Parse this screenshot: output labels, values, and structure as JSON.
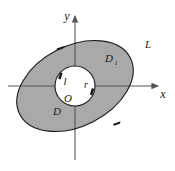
{
  "figure": {
    "background_color": "#ffffff",
    "shaded_fill_color": "#a9a9a9",
    "stroke_color": "#1a1a1a",
    "axis_color": "#555555",
    "inner_fill_color": "#ffffff",
    "axes": {
      "x_label": "x",
      "y_label": "y",
      "origin_label": "O"
    },
    "labels": {
      "outer_curve": "L",
      "inner_curve": "l",
      "inner_radius": "r",
      "outer_region": "D",
      "inner_region_main": "D",
      "inner_region_sub": "1"
    },
    "geometry": {
      "origin_x": 75,
      "origin_y": 86,
      "ellipse_rx": 62,
      "ellipse_ry": 40,
      "ellipse_rotation_deg": -27,
      "circle_r": 20
    },
    "orientation_arrows": [
      "outer-ellipse-upper-left-arrow",
      "outer-ellipse-lower-right-arrow",
      "inner-circle-upper-left-arrow",
      "inner-circle-right-arrow"
    ]
  }
}
